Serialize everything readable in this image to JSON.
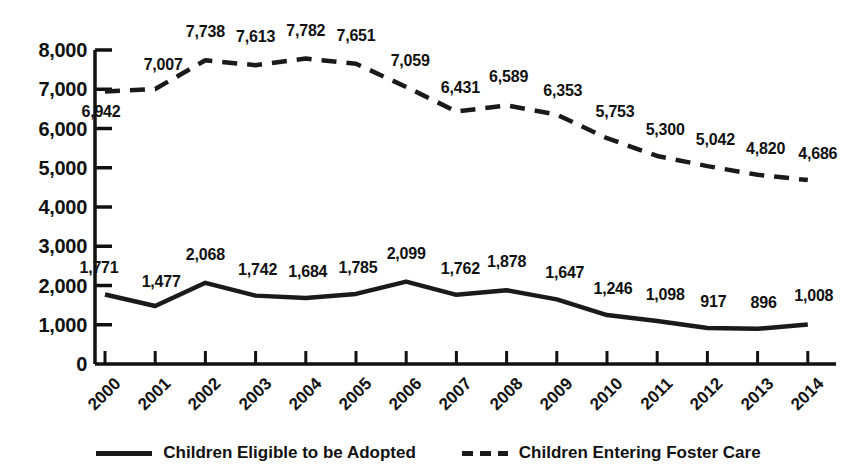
{
  "chart_data": {
    "type": "line",
    "title": "",
    "subtitle": "",
    "xlabel": "",
    "ylabel": "",
    "categories": [
      "2000",
      "2001",
      "2002",
      "2003",
      "2004",
      "2005",
      "2006",
      "2007",
      "2008",
      "2009",
      "2010",
      "2011",
      "2012",
      "2013",
      "2014"
    ],
    "ylim": [
      0,
      8000
    ],
    "ytick_values": [
      0,
      1000,
      2000,
      3000,
      4000,
      5000,
      6000,
      7000,
      8000
    ],
    "ytick_labels": [
      "0",
      "1,000",
      "2,000",
      "3,000",
      "4,000",
      "5,000",
      "6,000",
      "7,000",
      "8,000"
    ],
    "grid": false,
    "legend_position": "bottom",
    "series": [
      {
        "name": "Children Eligible to be Adopted",
        "style": "solid",
        "color": "#1a1a1a",
        "values": [
          1771,
          1477,
          2068,
          1742,
          1684,
          1785,
          2099,
          1762,
          1878,
          1647,
          1246,
          1098,
          917,
          896,
          1008
        ],
        "labels": [
          "1,771",
          "1,477",
          "2,068",
          "1,742",
          "1,684",
          "1,785",
          "2,099",
          "1,762",
          "1,878",
          "1,647",
          "1,246",
          "1,098",
          "917",
          "896",
          "1,008"
        ]
      },
      {
        "name": "Children Entering Foster Care",
        "style": "dashed",
        "color": "#1a1a1a",
        "values": [
          6942,
          7007,
          7738,
          7613,
          7782,
          7651,
          7059,
          6431,
          6589,
          6353,
          5753,
          5300,
          5042,
          4820,
          4686
        ],
        "labels": [
          "6,942",
          "7,007",
          "7,738",
          "7,613",
          "7,782",
          "7,651",
          "7,059",
          "6,431",
          "6,589",
          "6,353",
          "5,753",
          "5,300",
          "5,042",
          "4,820",
          "4,686"
        ]
      }
    ]
  },
  "legend": {
    "items": [
      {
        "label": "Children Eligible to be Adopted",
        "marker": "solid-line-marker"
      },
      {
        "label": "Children Entering Foster Care",
        "marker": "dashed-line-marker"
      }
    ]
  }
}
